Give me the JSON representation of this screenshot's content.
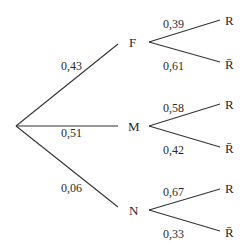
{
  "tree": {
    "first_level": [
      {
        "node": "F",
        "prob": "0,43"
      },
      {
        "node": "M",
        "prob": "0,51"
      },
      {
        "node": "N",
        "prob": "0,06"
      }
    ],
    "second_level": {
      "F": [
        {
          "leaf": "R",
          "prob": "0,39"
        },
        {
          "leaf": "R̄",
          "prob": "0,61"
        }
      ],
      "M": [
        {
          "leaf": "R",
          "prob": "0,58"
        },
        {
          "leaf": "R̄",
          "prob": "0,42"
        }
      ],
      "N": [
        {
          "leaf": "R",
          "prob": "0,67"
        },
        {
          "leaf": "R̄",
          "prob": "0,33"
        }
      ]
    }
  }
}
